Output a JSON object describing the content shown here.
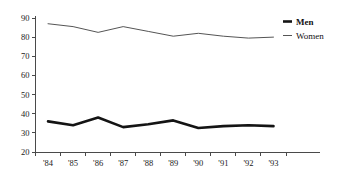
{
  "chart_data": {
    "type": "line",
    "title": "",
    "subtitle": "",
    "xlabel": "",
    "ylabel": "",
    "categories": [
      "'84",
      "'85",
      "'86",
      "'87",
      "'88",
      "'89",
      "'90",
      "'91",
      "'92",
      "'93"
    ],
    "series": [
      {
        "name": "Men",
        "values": [
          36,
          34,
          38,
          33,
          34.5,
          36.5,
          32.5,
          33.5,
          34,
          33.5
        ],
        "color": "#141414",
        "line_style": "thick"
      },
      {
        "name": "Women",
        "values": [
          87,
          85.5,
          82.5,
          85.5,
          83,
          80.5,
          82,
          80.5,
          79.5,
          80
        ],
        "color": "#555555",
        "line_style": "thin"
      }
    ],
    "ylim": [
      20,
      90
    ],
    "yticks": [
      20,
      30,
      40,
      50,
      60,
      70,
      80,
      90
    ],
    "ytick_labels": [
      "20",
      "30",
      "40",
      "50",
      "60",
      "70",
      "80",
      "90"
    ],
    "xtick_labels": [
      "'84",
      "'85",
      "'86",
      "'87",
      "'88",
      "'89",
      "'90",
      "'91",
      "'92",
      "'93"
    ],
    "grid": false,
    "legend_position": "top-right",
    "legend": [
      {
        "label": "Men",
        "color": "#141414"
      },
      {
        "label": "Women",
        "color": "#555555"
      }
    ],
    "axis_color": "#4a4a4a",
    "background_color": "#ffffff"
  }
}
